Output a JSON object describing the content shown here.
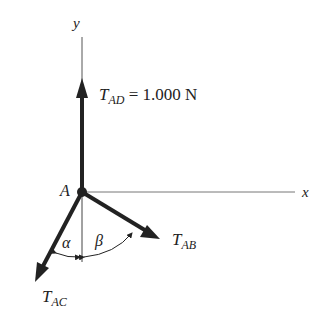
{
  "diagram": {
    "axes": {
      "y_label": "y",
      "x_label": "x"
    },
    "point": {
      "label": "A"
    },
    "forces": {
      "t_ad": {
        "symbol": "T",
        "subscript": "AD",
        "equals": " = 1.000 N"
      },
      "t_ab": {
        "symbol": "T",
        "subscript": "AB"
      },
      "t_ac": {
        "symbol": "T",
        "subscript": "AC"
      }
    },
    "angles": {
      "alpha": "α",
      "beta": "β"
    },
    "colors": {
      "ink": "#222222",
      "axis": "#555555",
      "background": "#ffffff"
    }
  }
}
